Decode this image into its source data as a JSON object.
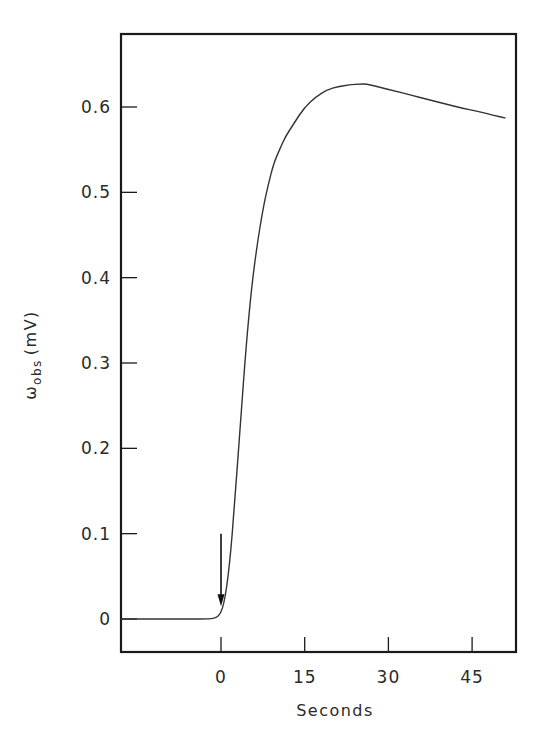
{
  "chart_data": {
    "type": "line",
    "title": "",
    "xlabel": "Seconds",
    "ylabel": "ωobs (mV)",
    "ylabel_main": "ω",
    "ylabel_sub": "obs",
    "ylabel_unit": "(mV)",
    "xlim": [
      -18,
      52
    ],
    "ylim": [
      -0.04,
      0.69
    ],
    "grid": false,
    "legend": null,
    "x_ticks": [
      0,
      15,
      30,
      45
    ],
    "x_tick_labels": [
      "0",
      "15",
      "30",
      "45"
    ],
    "y_ticks": [
      0,
      0.1,
      0.2,
      0.3,
      0.4,
      0.5,
      0.6
    ],
    "y_tick_labels": [
      "0",
      "0.1",
      "0.2",
      "0.3",
      "0.4",
      "0.5",
      "0.6"
    ],
    "annotations": [
      {
        "type": "arrow",
        "x": 0,
        "y_from": 0.1,
        "y_to": 0.015,
        "description": "downward arrow marking stimulus at t = 0"
      }
    ],
    "series": [
      {
        "name": "observed signal",
        "x": [
          -18,
          -14,
          -10,
          -6,
          -2,
          -0.5,
          0.5,
          1.5,
          2.5,
          3.5,
          4.5,
          5.5,
          6.5,
          7.5,
          8.5,
          9.5,
          10.5,
          11.5,
          13,
          15,
          17,
          19,
          21,
          23,
          25,
          26,
          28,
          31,
          34,
          37,
          40,
          43,
          46,
          49,
          51
        ],
        "values": [
          0,
          0,
          0,
          0,
          0,
          0.002,
          0.015,
          0.06,
          0.14,
          0.23,
          0.32,
          0.39,
          0.44,
          0.48,
          0.51,
          0.535,
          0.55,
          0.565,
          0.58,
          0.6,
          0.612,
          0.62,
          0.624,
          0.626,
          0.627,
          0.627,
          0.624,
          0.619,
          0.614,
          0.609,
          0.604,
          0.599,
          0.595,
          0.59,
          0.587
        ]
      }
    ]
  }
}
